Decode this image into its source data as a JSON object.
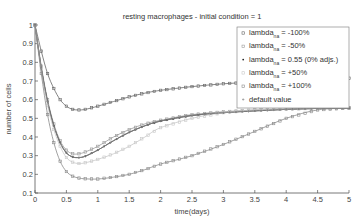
{
  "chart_data": {
    "type": "line",
    "title": "resting macrophages - initial condition = 1",
    "xlabel": "time(days)",
    "ylabel": "number of cells",
    "xlim": [
      0,
      5
    ],
    "ylim": [
      0.1,
      1
    ],
    "xticks": [
      "0",
      "0.5",
      "1",
      "1.5",
      "2",
      "2.5",
      "3",
      "3.5",
      "4",
      "4.5",
      "5"
    ],
    "yticks": [
      "0.1",
      "0.2",
      "0.3",
      "0.4",
      "0.5",
      "0.6",
      "0.7",
      "0.8",
      "0.9",
      "1"
    ],
    "grid": false,
    "legend_position": "upper right",
    "x": [
      0,
      0.1,
      0.2,
      0.3,
      0.4,
      0.5,
      0.6,
      0.7,
      0.8,
      1.0,
      1.25,
      1.5,
      1.75,
      2.0,
      2.5,
      3.0,
      3.5,
      4.0,
      4.5,
      5.0
    ],
    "series": [
      {
        "name": "lambda_na = -100%",
        "color": "#666666",
        "marker": "square",
        "values": [
          1.0,
          0.86,
          0.74,
          0.66,
          0.6,
          0.565,
          0.548,
          0.545,
          0.548,
          0.565,
          0.59,
          0.615,
          0.635,
          0.65,
          0.67,
          0.685,
          0.695,
          0.705,
          0.71,
          0.715
        ]
      },
      {
        "name": "lambda_na = -50%",
        "color": "#9a9a9a",
        "marker": "square",
        "values": [
          1.0,
          0.78,
          0.6,
          0.47,
          0.38,
          0.33,
          0.31,
          0.31,
          0.32,
          0.35,
          0.4,
          0.44,
          0.47,
          0.49,
          0.52,
          0.535,
          0.545,
          0.55,
          0.555,
          0.557
        ]
      },
      {
        "name": "lambda_na = 0.55 (0% adjs.)",
        "color": "#222222",
        "marker": "dot",
        "values": [
          1.0,
          0.77,
          0.59,
          0.46,
          0.37,
          0.315,
          0.293,
          0.29,
          0.297,
          0.33,
          0.38,
          0.425,
          0.46,
          0.485,
          0.515,
          0.53,
          0.54,
          0.548,
          0.553,
          0.555
        ]
      },
      {
        "name": "lambda_na = +50%",
        "color": "#c8c8c8",
        "marker": "square",
        "values": [
          1.0,
          0.76,
          0.57,
          0.44,
          0.35,
          0.29,
          0.265,
          0.258,
          0.262,
          0.28,
          0.31,
          0.35,
          0.4,
          0.45,
          0.5,
          0.53,
          0.545,
          0.55,
          0.553,
          0.555
        ]
      },
      {
        "name": "lambda_na = +100%",
        "color": "#8a8a8a",
        "marker": "square",
        "values": [
          1.0,
          0.74,
          0.52,
          0.37,
          0.27,
          0.215,
          0.19,
          0.18,
          0.176,
          0.175,
          0.185,
          0.2,
          0.225,
          0.255,
          0.3,
          0.36,
          0.43,
          0.5,
          0.545,
          0.555
        ]
      },
      {
        "name": "default value",
        "color": "#888888",
        "marker": "star",
        "values": [
          1.0,
          0.77,
          0.59,
          0.46,
          0.37,
          0.315,
          0.293,
          0.29,
          0.297,
          0.33,
          0.38,
          0.425,
          0.46,
          0.485,
          0.515,
          0.53,
          0.54,
          0.548,
          0.553,
          0.555
        ]
      }
    ]
  },
  "legend": {
    "items": [
      {
        "main": "lambda",
        "sub": "na",
        "rest": " = -100%"
      },
      {
        "main": "lambda",
        "sub": "na",
        "rest": " = -50%"
      },
      {
        "main": "lambda",
        "sub": "na",
        "rest": " = 0.55 (0% adjs.)"
      },
      {
        "main": "lambda",
        "sub": "na",
        "rest": " = +50%"
      },
      {
        "main": "lambda",
        "sub": "na",
        "rest": " = +100%"
      },
      {
        "main": "default value",
        "sub": "",
        "rest": ""
      }
    ]
  }
}
